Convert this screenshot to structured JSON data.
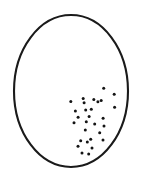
{
  "canvas": {
    "width": 144,
    "height": 185,
    "background_color": "#ffffff"
  },
  "figure": {
    "outline": {
      "shape": "ellipse",
      "center_x": 71,
      "center_y": 91,
      "radius_x": 57,
      "radius_y": 76,
      "stroke_color": "#1a1a1a",
      "stroke_width": 2.1,
      "fill_color": "#ffffff"
    },
    "dots": {
      "color": "#141414",
      "radius": 1.5,
      "count": 29,
      "points": [
        {
          "x": 103.7,
          "y": 88.3
        },
        {
          "x": 114.2,
          "y": 94.2
        },
        {
          "x": 83.2,
          "y": 98.6
        },
        {
          "x": 93.8,
          "y": 99.6
        },
        {
          "x": 101.2,
          "y": 100.6
        },
        {
          "x": 70.8,
          "y": 101.4
        },
        {
          "x": 84.1,
          "y": 102.8
        },
        {
          "x": 97.9,
          "y": 101.8
        },
        {
          "x": 114.6,
          "y": 107.2
        },
        {
          "x": 75.4,
          "y": 111.0
        },
        {
          "x": 85.7,
          "y": 109.9
        },
        {
          "x": 91.3,
          "y": 109.3
        },
        {
          "x": 78.1,
          "y": 117.3
        },
        {
          "x": 89.1,
          "y": 116.6
        },
        {
          "x": 103.1,
          "y": 118.3
        },
        {
          "x": 74.0,
          "y": 122.7
        },
        {
          "x": 86.3,
          "y": 121.7
        },
        {
          "x": 94.7,
          "y": 124.0
        },
        {
          "x": 104.0,
          "y": 126.0
        },
        {
          "x": 85.3,
          "y": 130.0
        },
        {
          "x": 99.7,
          "y": 132.7
        },
        {
          "x": 80.7,
          "y": 140.7
        },
        {
          "x": 90.7,
          "y": 139.3
        },
        {
          "x": 103.0,
          "y": 140.0
        },
        {
          "x": 87.3,
          "y": 142.0
        },
        {
          "x": 78.0,
          "y": 146.3
        },
        {
          "x": 92.0,
          "y": 148.0
        },
        {
          "x": 82.0,
          "y": 153.0
        },
        {
          "x": 88.7,
          "y": 154.0
        }
      ]
    }
  }
}
